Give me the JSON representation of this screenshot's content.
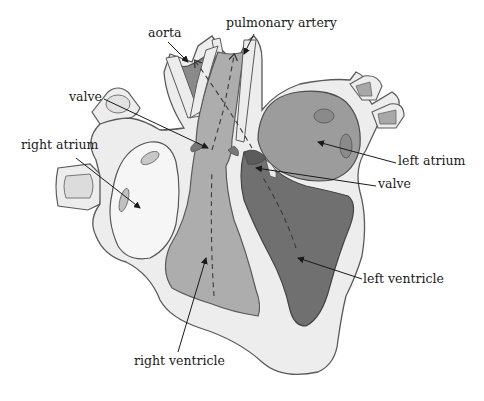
{
  "diagram": {
    "type": "anatomical-cross-section",
    "style": "grayscale illustration",
    "colors": {
      "wall": "#ededed",
      "wall_outline": "#5a5a5a",
      "right_side_chambers": "#a9a9a9",
      "left_ventricle": "#6e6e6e",
      "left_atrium": "#9a9a9a",
      "right_atrium": "#f4f4f4",
      "leader_line": "#1a1a1a"
    },
    "labels": [
      {
        "id": "aorta",
        "text": "aorta"
      },
      {
        "id": "pulmonary-artery",
        "text": "pulmonary artery"
      },
      {
        "id": "valve-pulmonary",
        "text": "valve"
      },
      {
        "id": "right-atrium",
        "text": "right atrium"
      },
      {
        "id": "left-atrium",
        "text": "left atrium"
      },
      {
        "id": "valve-mitral",
        "text": "valve"
      },
      {
        "id": "left-ventricle",
        "text": "left ventricle"
      },
      {
        "id": "right-ventricle",
        "text": "right ventricle"
      }
    ]
  }
}
